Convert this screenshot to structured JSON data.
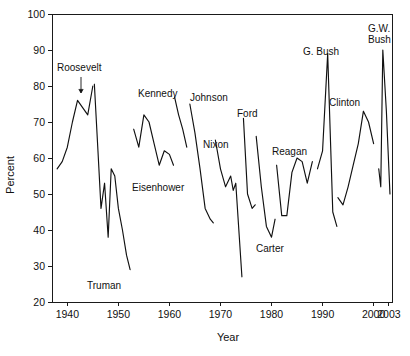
{
  "chart_data": {
    "type": "line",
    "title": "",
    "xlabel": "Year",
    "ylabel": "Percent",
    "xlim": [
      1937,
      2003.6
    ],
    "ylim": [
      20,
      100
    ],
    "grid": false,
    "legend_position": "none",
    "xticks": [
      1940,
      1950,
      1960,
      1970,
      1980,
      1990,
      2000,
      2003
    ],
    "xtick_labels": [
      "1940",
      "1950",
      "1960",
      "1970",
      "1980",
      "1990",
      "2000",
      "2003"
    ],
    "yticks": [
      20,
      30,
      40,
      50,
      60,
      70,
      80,
      90,
      100
    ],
    "ytick_labels": [
      "20",
      "30",
      "40",
      "50",
      "60",
      "70",
      "80",
      "90",
      "100"
    ],
    "series": [
      {
        "name": "Roosevelt",
        "x": [
          1938.0,
          1939.0,
          1940.0,
          1941.0,
          1942.0,
          1943.0,
          1944.0,
          1945.0
        ],
        "values": [
          57,
          59,
          63,
          70,
          76,
          74,
          72,
          80
        ]
      },
      {
        "name": "Truman",
        "x": [
          1945.3,
          1946.0,
          1946.6,
          1947.3,
          1948.0,
          1948.6,
          1949.3,
          1950.0,
          1950.8,
          1951.6,
          1952.3
        ],
        "values": [
          80.5,
          62,
          46,
          53,
          38,
          57,
          55,
          46,
          40,
          33,
          29
        ]
      },
      {
        "name": "Eisenhower",
        "x": [
          1953.0,
          1954.0,
          1955.0,
          1956.0,
          1957.0,
          1958.0,
          1959.0,
          1960.0,
          1960.8
        ],
        "values": [
          68,
          63,
          72,
          70,
          64,
          58,
          62,
          61,
          58
        ]
      },
      {
        "name": "Kennedy",
        "x": [
          1961.0,
          1961.8,
          1962.6,
          1963.4
        ],
        "values": [
          77,
          72,
          68,
          63
        ]
      },
      {
        "name": "Johnson",
        "x": [
          1964.0,
          1965.0,
          1966.0,
          1967.0,
          1968.0,
          1968.6
        ],
        "values": [
          75,
          67,
          57,
          46,
          43,
          42
        ]
      },
      {
        "name": "Nixon",
        "x": [
          1969.0,
          1970.0,
          1971.0,
          1972.0,
          1972.5,
          1973.0,
          1974.2
        ],
        "values": [
          65,
          57,
          52,
          55,
          51,
          53,
          27
        ]
      },
      {
        "name": "Ford",
        "x": [
          1974.5,
          1975.3,
          1976.2,
          1976.8
        ],
        "values": [
          71,
          50,
          46,
          47
        ]
      },
      {
        "name": "Carter",
        "x": [
          1977.0,
          1978.0,
          1979.0,
          1980.0,
          1980.7
        ],
        "values": [
          66,
          52,
          41,
          38,
          43
        ]
      },
      {
        "name": "Reagan",
        "x": [
          1981.0,
          1982.0,
          1983.0,
          1984.0,
          1985.0,
          1986.0,
          1987.0,
          1988.0
        ],
        "values": [
          58,
          44,
          44,
          56,
          60,
          59,
          53,
          59
        ]
      },
      {
        "name": "G. Bush",
        "x": [
          1989.0,
          1990.0,
          1991.0,
          1992.0,
          1992.8
        ],
        "values": [
          57,
          62,
          89,
          45,
          41
        ]
      },
      {
        "name": "Clinton",
        "x": [
          1993.0,
          1994.0,
          1995.0,
          1996.0,
          1997.0,
          1998.0,
          1999.0,
          2000.0
        ],
        "values": [
          49,
          47,
          52,
          58,
          64,
          73,
          70,
          64
        ]
      },
      {
        "name": "G.W. Bush",
        "x": [
          2001.0,
          2001.4,
          2001.8,
          2002.5,
          2003.2
        ],
        "values": [
          57,
          52,
          90,
          73,
          50
        ]
      }
    ],
    "annotations": [
      {
        "label": "Roosevelt",
        "x_px": 57,
        "y_px": 71,
        "anchor": "start",
        "leader": {
          "x1": 81,
          "y1": 77,
          "x2": 81,
          "y2": 93
        }
      },
      {
        "label": "Truman",
        "x_px": 87,
        "y_px": 289,
        "anchor": "start",
        "leader": null
      },
      {
        "label": "Eisenhower",
        "x_px": 132,
        "y_px": 191,
        "anchor": "start",
        "leader": null
      },
      {
        "label": "Kennedy",
        "x_px": 138,
        "y_px": 97,
        "anchor": "start",
        "leader": null
      },
      {
        "label": "Johnson",
        "x_px": 190,
        "y_px": 101,
        "anchor": "start",
        "leader": null
      },
      {
        "label": "Nixon",
        "x_px": 203,
        "y_px": 148,
        "anchor": "start",
        "leader": null
      },
      {
        "label": "Ford",
        "x_px": 237,
        "y_px": 117,
        "anchor": "start",
        "leader": null
      },
      {
        "label": "Carter",
        "x_px": 256,
        "y_px": 252,
        "anchor": "start",
        "leader": null
      },
      {
        "label": "Reagan",
        "x_px": 272,
        "y_px": 155,
        "anchor": "start",
        "leader": null
      },
      {
        "label": "G. Bush",
        "x_px": 303,
        "y_px": 55,
        "anchor": "start",
        "leader": null
      },
      {
        "label": "Clinton",
        "x_px": 329,
        "y_px": 106,
        "anchor": "start",
        "leader": null
      },
      {
        "label": "G.W. Bush",
        "x_px": 368,
        "y_px": 32,
        "anchor": "start",
        "leader": null,
        "line2": "Bush",
        "line1": "G.W."
      }
    ]
  },
  "axes": {
    "y_label": "Percent",
    "x_label": "Year"
  }
}
